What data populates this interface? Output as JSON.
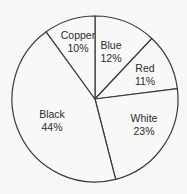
{
  "chart_data": {
    "type": "pie",
    "title": "",
    "categories": [
      "Blue",
      "Red",
      "White",
      "Black",
      "Copper"
    ],
    "values": [
      12,
      11,
      23,
      44,
      10
    ],
    "labels": [
      "12%",
      "11%",
      "23%",
      "44%",
      "10%"
    ],
    "unit": "%",
    "start_angle_deg": 90,
    "direction": "clockwise",
    "legend": "none (inline labels)",
    "colors": {
      "fill": "#f8f8f7",
      "stroke": "#3a3a3a",
      "text": "#2b2b2b",
      "background": "#f7f7f6"
    }
  },
  "slices": [
    {
      "name": "Blue",
      "pct": "12%"
    },
    {
      "name": "Red",
      "pct": "11%"
    },
    {
      "name": "White",
      "pct": "23%"
    },
    {
      "name": "Black",
      "pct": "44%"
    },
    {
      "name": "Copper",
      "pct": "10%"
    }
  ]
}
